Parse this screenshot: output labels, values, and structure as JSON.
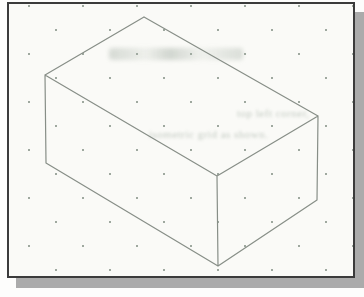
{
  "figure": {
    "kind": "scanned-textbook-figure",
    "frame": {
      "border_color": "#3b3b3b",
      "shadow_color": "#ababab",
      "paper_color": "#fafaf7",
      "dot_color": "#6e7d70"
    }
  },
  "drawing": {
    "type": "isometric-box-wireframe",
    "line_color": "#878e87",
    "vertices": {
      "top_apex": [
        135,
        13
      ],
      "top_left": [
        36,
        71
      ],
      "top_right": [
        309,
        112
      ],
      "front_top": [
        208,
        172
      ],
      "bottom_left": [
        37,
        159
      ],
      "front_bottom": [
        209,
        262
      ],
      "bottom_right": [
        308,
        196
      ]
    },
    "edges": [
      [
        "top_apex",
        "top_left"
      ],
      [
        "top_apex",
        "top_right"
      ],
      [
        "top_left",
        "front_top"
      ],
      [
        "top_right",
        "front_top"
      ],
      [
        "top_left",
        "bottom_left"
      ],
      [
        "front_top",
        "front_bottom"
      ],
      [
        "top_right",
        "bottom_right"
      ],
      [
        "bottom_left",
        "front_bottom"
      ],
      [
        "front_bottom",
        "bottom_right"
      ]
    ],
    "canvas": {
      "width": 344,
      "height": 272
    }
  },
  "ghost_text": {
    "fragment_1": "top left corner,",
    "fragment_2": "isometric grid as shown."
  }
}
